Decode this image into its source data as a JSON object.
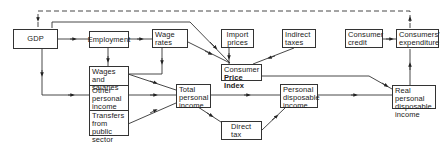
{
  "diagram": {
    "nodes": {
      "gdp": "GDP",
      "employment": "Employment",
      "wage_rates": "Wage rates",
      "import_prices": "Import prices",
      "indirect_taxes": "Indirect taxes",
      "consumer_credit": "Consumer credit",
      "consumers_expenditure": "Consumers' expenditure",
      "wages_and_salaries": "Wages and salaries",
      "other_personal_income": "Other personal income",
      "transfers_from_public_sector": "Transfers from public sector",
      "total_personal_income": "Total personal income",
      "cpi_line1": "Consumer",
      "cpi_line2": "Price Index",
      "personal_disposable_income": "Personal disposable income",
      "real_personal_disposable_income": "Real personal disposable income",
      "direct_tax": "Direct tax"
    },
    "edges": [
      {
        "from": "GDP",
        "to": "Employment",
        "style": "solid"
      },
      {
        "from": "Employment",
        "to": "Wage rates",
        "style": "solid"
      },
      {
        "from": "Employment",
        "to": "Wages and salaries",
        "style": "solid"
      },
      {
        "from": "GDP",
        "to": "Other personal income",
        "style": "solid"
      },
      {
        "from": "GDP",
        "to": "Consumer Price Index",
        "style": "solid"
      },
      {
        "from": "Wage rates",
        "to": "Consumer Price Index",
        "style": "solid"
      },
      {
        "from": "Wage rates",
        "to": "Wages and salaries",
        "style": "solid"
      },
      {
        "from": "Import prices",
        "to": "Consumer Price Index",
        "style": "solid"
      },
      {
        "from": "Indirect taxes",
        "to": "Consumer Price Index",
        "style": "solid"
      },
      {
        "from": "Wages and salaries",
        "to": "Total personal income",
        "style": "solid"
      },
      {
        "from": "Other personal income",
        "to": "Total personal income",
        "style": "solid"
      },
      {
        "from": "Transfers from public sector",
        "to": "Total personal income",
        "style": "solid"
      },
      {
        "from": "Total personal income",
        "to": "Personal disposable income",
        "style": "solid"
      },
      {
        "from": "Total personal income",
        "to": "Direct tax",
        "style": "solid"
      },
      {
        "from": "Direct tax",
        "to": "Personal disposable income",
        "style": "solid"
      },
      {
        "from": "Personal disposable income",
        "to": "Real personal disposable income",
        "style": "solid"
      },
      {
        "from": "Consumer Price Index",
        "to": "Real personal disposable income",
        "style": "solid"
      },
      {
        "from": "Real personal disposable income",
        "to": "Consumers' expenditure",
        "style": "solid"
      },
      {
        "from": "Consumer credit",
        "to": "Consumers' expenditure",
        "style": "solid"
      },
      {
        "from": "Consumers' expenditure",
        "to": "GDP",
        "style": "dashed"
      }
    ]
  }
}
